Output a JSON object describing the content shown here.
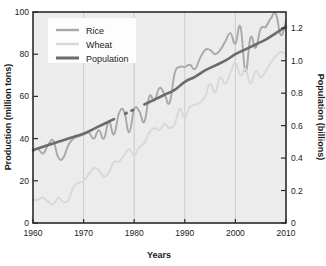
{
  "chart_data": {
    "type": "line",
    "title": "",
    "xlabel": "Years",
    "ylabel": "Production (million tons)",
    "y2label": "Population (billions)",
    "xlim": [
      1960,
      2010
    ],
    "ylim": [
      0,
      100
    ],
    "y2lim": [
      0,
      1.3
    ],
    "xticks": [
      "1960",
      "1970",
      "1980",
      "1990",
      "2000",
      "2010"
    ],
    "xtick_values": [
      1960,
      1970,
      1980,
      1990,
      2000,
      2010
    ],
    "yticks": [
      "0",
      "20",
      "40",
      "60",
      "80",
      "100"
    ],
    "ytick_values": [
      0,
      20,
      40,
      60,
      80,
      100
    ],
    "y2ticks": [
      "0",
      "0.2",
      "0.4",
      "0.6",
      "0.8",
      "1.0",
      "1.2"
    ],
    "y2tick_values": [
      0,
      0.2,
      0.4,
      0.6,
      0.8,
      1.0,
      1.2
    ],
    "grid": "vertical-only",
    "legend_position": "top-left-inside",
    "series": [
      {
        "name": "Rice",
        "axis": "left",
        "color": "#a8a8a8",
        "units": "million tons",
        "x": [
          1960,
          1961,
          1962,
          1963,
          1964,
          1965,
          1966,
          1967,
          1968,
          1969,
          1970,
          1971,
          1972,
          1973,
          1974,
          1975,
          1976,
          1977,
          1978,
          1979,
          1980,
          1981,
          1982,
          1983,
          1984,
          1985,
          1986,
          1987,
          1988,
          1989,
          1990,
          1991,
          1992,
          1993,
          1994,
          1995,
          1996,
          1997,
          1998,
          1999,
          2000,
          2001,
          2002,
          2003,
          2004,
          2005,
          2006,
          2007,
          2008,
          2009,
          2010
        ],
        "values": [
          34,
          35,
          33,
          37,
          39,
          31,
          31,
          37,
          40,
          41,
          42,
          43,
          40,
          44,
          40,
          48,
          42,
          52,
          53,
          43,
          54,
          53,
          48,
          60,
          58,
          64,
          61,
          57,
          71,
          74,
          74,
          75,
          73,
          78,
          82,
          82,
          80,
          82,
          86,
          90,
          85,
          93,
          72,
          88,
          83,
          92,
          93,
          97,
          99,
          89,
          96
        ]
      },
      {
        "name": "Wheat",
        "axis": "left",
        "color": "#d8d8d8",
        "units": "million tons",
        "x": [
          1960,
          1961,
          1962,
          1963,
          1964,
          1965,
          1966,
          1967,
          1968,
          1969,
          1970,
          1971,
          1972,
          1973,
          1974,
          1975,
          1976,
          1977,
          1978,
          1979,
          1980,
          1981,
          1982,
          1983,
          1984,
          1985,
          1986,
          1987,
          1988,
          1989,
          1990,
          1991,
          1992,
          1993,
          1994,
          1995,
          1996,
          1997,
          1998,
          1999,
          2000,
          2001,
          2002,
          2003,
          2004,
          2005,
          2006,
          2007,
          2008,
          2009,
          2010
        ],
        "values": [
          11,
          11,
          12,
          10,
          9,
          12,
          10,
          11,
          17,
          19,
          20,
          23,
          26,
          25,
          22,
          24,
          29,
          29,
          32,
          35,
          32,
          36,
          38,
          43,
          45,
          44,
          47,
          45,
          47,
          54,
          50,
          55,
          56,
          57,
          60,
          66,
          62,
          69,
          66,
          71,
          76,
          70,
          73,
          66,
          72,
          69,
          72,
          76,
          79,
          81,
          80
        ]
      },
      {
        "name": "Population",
        "axis": "right",
        "color": "#6b6b6b",
        "units": "billions",
        "x": [
          1960,
          1962,
          1964,
          1966,
          1968,
          1970,
          1972,
          1974,
          1976,
          1978,
          1980,
          1982,
          1984,
          1986,
          1988,
          1990,
          1992,
          1994,
          1996,
          1998,
          2000,
          2002,
          2004,
          2006,
          2008,
          2010
        ],
        "values": [
          0.45,
          0.47,
          0.49,
          0.51,
          0.53,
          0.55,
          0.58,
          0.61,
          0.64,
          0.67,
          0.7,
          0.73,
          0.76,
          0.79,
          0.82,
          0.87,
          0.9,
          0.94,
          0.97,
          1.0,
          1.04,
          1.07,
          1.1,
          1.13,
          1.17,
          1.21
        ],
        "dashed_segment": [
          1977,
          1981
        ]
      }
    ],
    "annotations": []
  },
  "legend": {
    "items": [
      {
        "label": "Rice"
      },
      {
        "label": "Wheat"
      },
      {
        "label": "Population"
      }
    ]
  }
}
